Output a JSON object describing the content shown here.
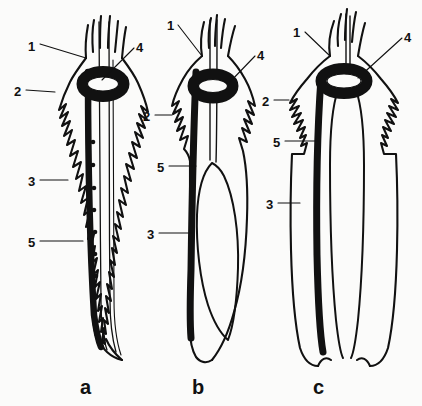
{
  "figure": {
    "domain_note": "line-drawing morphology plate",
    "background_color": "#fbfbfa",
    "ink_color": "#111111",
    "panels": [
      {
        "key": "a",
        "letter": "a",
        "letter_x": 80,
        "letter_y": 377
      },
      {
        "key": "b",
        "letter": "b",
        "letter_x": 192,
        "letter_y": 377
      },
      {
        "key": "c",
        "letter": "c",
        "letter_x": 313,
        "letter_y": 377
      }
    ],
    "labels": [
      {
        "id": "a-1",
        "panel": "a",
        "text": "1",
        "x": 28,
        "y": 40
      },
      {
        "id": "a-2",
        "panel": "a",
        "text": "2",
        "x": 14,
        "y": 85
      },
      {
        "id": "a-3",
        "panel": "a",
        "text": "3",
        "x": 28,
        "y": 175
      },
      {
        "id": "a-5",
        "panel": "a",
        "text": "5",
        "x": 28,
        "y": 236
      },
      {
        "id": "a-4",
        "panel": "a",
        "text": "4",
        "x": 136,
        "y": 41
      },
      {
        "id": "b-1",
        "panel": "b",
        "text": "1",
        "x": 167,
        "y": 19
      },
      {
        "id": "b-2",
        "panel": "b",
        "text": "2",
        "x": 143,
        "y": 110
      },
      {
        "id": "b-5",
        "panel": "b",
        "text": "5",
        "x": 157,
        "y": 161
      },
      {
        "id": "b-3",
        "panel": "b",
        "text": "3",
        "x": 147,
        "y": 228
      },
      {
        "id": "b-4",
        "panel": "b",
        "text": "4",
        "x": 257,
        "y": 49
      },
      {
        "id": "c-1",
        "panel": "c",
        "text": "1",
        "x": 293,
        "y": 26
      },
      {
        "id": "c-2",
        "panel": "c",
        "text": "2",
        "x": 262,
        "y": 95
      },
      {
        "id": "c-5",
        "panel": "c",
        "text": "5",
        "x": 273,
        "y": 136
      },
      {
        "id": "c-3",
        "panel": "c",
        "text": "3",
        "x": 266,
        "y": 198
      },
      {
        "id": "c-4",
        "panel": "c",
        "text": "4",
        "x": 404,
        "y": 31
      }
    ],
    "leader_lines": [
      {
        "id": "a-1",
        "x1": 40,
        "y1": 44,
        "x2": 86,
        "y2": 58
      },
      {
        "id": "a-2",
        "x1": 26,
        "y1": 90,
        "x2": 55,
        "y2": 92
      },
      {
        "id": "a-3",
        "x1": 40,
        "y1": 180,
        "x2": 68,
        "y2": 180
      },
      {
        "id": "a-5",
        "x1": 40,
        "y1": 241,
        "x2": 83,
        "y2": 241
      },
      {
        "id": "a-4",
        "x1": 134,
        "y1": 48,
        "x2": 102,
        "y2": 80
      },
      {
        "id": "b-1",
        "x1": 178,
        "y1": 25,
        "x2": 202,
        "y2": 56
      },
      {
        "id": "b-2",
        "x1": 155,
        "y1": 115,
        "x2": 172,
        "y2": 115
      },
      {
        "id": "b-5",
        "x1": 169,
        "y1": 166,
        "x2": 196,
        "y2": 166
      },
      {
        "id": "b-3",
        "x1": 159,
        "y1": 233,
        "x2": 192,
        "y2": 233
      },
      {
        "id": "b-4",
        "x1": 255,
        "y1": 56,
        "x2": 228,
        "y2": 84
      },
      {
        "id": "c-1",
        "x1": 305,
        "y1": 32,
        "x2": 330,
        "y2": 56
      },
      {
        "id": "c-2",
        "x1": 274,
        "y1": 100,
        "x2": 289,
        "y2": 100
      },
      {
        "id": "c-5",
        "x1": 285,
        "y1": 141,
        "x2": 318,
        "y2": 141
      },
      {
        "id": "c-3",
        "x1": 278,
        "y1": 203,
        "x2": 300,
        "y2": 203
      },
      {
        "id": "c-4",
        "x1": 402,
        "y1": 38,
        "x2": 358,
        "y2": 78
      }
    ]
  }
}
